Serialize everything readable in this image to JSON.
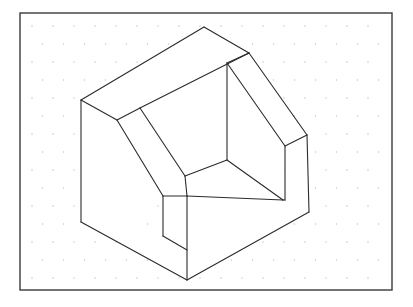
{
  "canvas": {
    "width": 413,
    "height": 307,
    "background_color": "#ffffff"
  },
  "frame": {
    "label": "drawing-sheet-border",
    "x": 20,
    "y": 13,
    "width": 372,
    "height": 277,
    "stroke_color": "#3a3a3a",
    "stroke_width": 1.4,
    "fill_color": "#ffffff"
  },
  "grid": {
    "label": "isometric-dot-grid",
    "dot_color": "#c9c4cc",
    "dot_radius": 0.75,
    "col_spacing": 21,
    "row_spacing": 18,
    "row_offset": 10.5,
    "origin_x": 32,
    "origin_y": 26,
    "cols": 18,
    "rows": 15
  },
  "drawing": {
    "title": "Isometric pictorial view of a block with a rectangular through-slot",
    "projection": "isometric",
    "stroke_color": "#2b2b2b",
    "stroke_width": 1.1,
    "face_fill": "#ffffff",
    "vertices": {
      "left_top": "81,100",
      "left_bottom": "81,222",
      "top_apex": "204,27",
      "ridge_right": "249,53",
      "back_inner_top": "227,63",
      "back_inner_bottom": "227,160",
      "right_slope_end": "307,135",
      "right_top_inner": "285,146",
      "right_bottom_outer": "309,212",
      "right_bottom_inner": "285,200",
      "front_bottom_apex": "187,280",
      "slot_front_top": "163,196",
      "slot_front_bottom": "163,236",
      "slot_left_upper": "140,108",
      "slot_left_lower": "117,120",
      "floor_front": "185,176",
      "floor_right": "283,200"
    },
    "faces": [
      {
        "name": "left-outer-vertical-face",
        "points": "81,100 81,222 187,280 187,196 163,196 163,236 140,224 140,108"
      },
      {
        "name": "top-ridge-band-face",
        "points": "81,100 204,27 249,53 140,108 117,120"
      },
      {
        "name": "right-slope-band-face",
        "points": "249,53 307,135 285,146 227,63"
      },
      {
        "name": "right-outer-vertical-face",
        "points": "307,135 309,212 285,200 285,146"
      },
      {
        "name": "inclined-slot-face",
        "points": "140,108 227,63 227,160 185,176 163,196 140,224"
      },
      {
        "name": "slot-floor-face",
        "points": "185,176 227,160 283,200 187,196"
      },
      {
        "name": "slot-right-inner-face",
        "points": "227,63 227,160 283,200 285,146"
      },
      {
        "name": "front-bottom-right-face",
        "points": "187,196 283,200 285,200 309,212 187,280"
      }
    ],
    "edges": [
      {
        "name": "edge-left-vertical-outer",
        "path": "M81,100 L81,222"
      },
      {
        "name": "edge-left-top-to-apex",
        "path": "M81,100 L204,27"
      },
      {
        "name": "edge-apex-to-ridge-right",
        "path": "M204,27 L249,53"
      },
      {
        "name": "edge-ridge-right-to-slope-end",
        "path": "M249,53 L307,135"
      },
      {
        "name": "edge-right-vertical-outer",
        "path": "M307,135 L309,212"
      },
      {
        "name": "edge-right-bottom-to-front-apex",
        "path": "M309,212 L187,280"
      },
      {
        "name": "edge-front-apex-to-left-bottom",
        "path": "M187,280 L81,222"
      },
      {
        "name": "edge-inner-ridge-left",
        "path": "M81,100 L117,120"
      },
      {
        "name": "edge-band-inner-left",
        "path": "M117,120 L140,108"
      },
      {
        "name": "edge-band-inner-top",
        "path": "M140,108 L249,53"
      },
      {
        "name": "edge-back-inner-vertical",
        "path": "M227,63 L227,160"
      },
      {
        "name": "edge-back-inner-top-to-ridge",
        "path": "M227,63 L249,53"
      },
      {
        "name": "edge-slope-inner",
        "path": "M227,63 L285,146"
      },
      {
        "name": "edge-right-inner-vertical",
        "path": "M285,146 L285,200"
      },
      {
        "name": "edge-right-slope-to-inner-top",
        "path": "M307,135 L285,146"
      },
      {
        "name": "edge-slot-incline-left",
        "path": "M117,120 L163,196"
      },
      {
        "name": "edge-slot-incline-right",
        "path": "M140,108 L185,176"
      },
      {
        "name": "edge-slot-front-vertical-left",
        "path": "M163,196 L163,236"
      },
      {
        "name": "edge-slot-front-vertical-right",
        "path": "M187,196 L187,280"
      },
      {
        "name": "edge-slot-front-lip",
        "path": "M163,196 L187,196"
      },
      {
        "name": "edge-slot-bottom-lip",
        "path": "M163,236 L187,250"
      },
      {
        "name": "edge-slot-floor-left",
        "path": "M185,176 L187,196"
      },
      {
        "name": "edge-slot-floor-back",
        "path": "M185,176 L227,160"
      },
      {
        "name": "edge-slot-floor-right",
        "path": "M227,160 L283,200"
      },
      {
        "name": "edge-slot-floor-front",
        "path": "M187,196 L283,200"
      },
      {
        "name": "edge-inner-right-corner",
        "path": "M283,200 L285,200"
      }
    ]
  }
}
